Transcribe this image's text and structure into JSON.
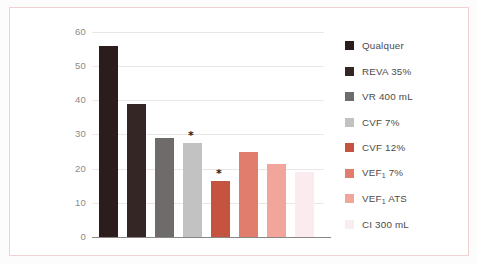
{
  "chart_data": {
    "type": "bar",
    "title": "",
    "subtitle": "",
    "xlabel": "",
    "ylabel": "",
    "ylim": [
      0,
      60
    ],
    "yticks": [
      "60",
      "50",
      "40",
      "30",
      "20",
      "10",
      "0"
    ],
    "grid": true,
    "legend_position": "right",
    "categories": [
      "Qualquer",
      "REVA 35%",
      "VR 400 mL",
      "CVF 7%",
      "CVF 12%",
      "VEF₁ 7%",
      "VEF₁ ATS",
      "CI 300 mL"
    ],
    "values": [
      56,
      39,
      29,
      27.5,
      16.5,
      25,
      21.5,
      19
    ],
    "colors": [
      "#2b1d1c",
      "#332624",
      "#6e6b6a",
      "#c3c2c3",
      "#c4543f",
      "#e07d6d",
      "#f2a69b",
      "#fbeaee"
    ],
    "annotations": [
      {
        "label": "*",
        "category": "CVF 7%",
        "value": 27.5
      },
      {
        "label": "*",
        "category": "CVF 12%",
        "value": 16.5
      }
    ]
  },
  "legend": {
    "items": [
      {
        "label": "Qualquer",
        "label_main": "Qualquer",
        "sub": "",
        "label_tail": "",
        "color": "#2b1d1c"
      },
      {
        "label": "REVA 35%",
        "label_main": "REVA 35%",
        "sub": "",
        "label_tail": "",
        "color": "#332624"
      },
      {
        "label": "VR 400 mL",
        "label_main": "VR 400 mL",
        "sub": "",
        "label_tail": "",
        "color": "#6e6b6a"
      },
      {
        "label": "CVF 7%",
        "label_main": "CVF 7%",
        "sub": "",
        "label_tail": "",
        "color": "#c3c2c3"
      },
      {
        "label": "CVF 12%",
        "label_main": "CVF 12%",
        "sub": "",
        "label_tail": "",
        "color": "#c4543f"
      },
      {
        "label": "VEF₁ 7%",
        "label_main": "VEF",
        "sub": "1",
        "label_tail": " 7%",
        "color": "#e07d6d"
      },
      {
        "label": "VEF₁ ATS",
        "label_main": "VEF",
        "sub": "1",
        "label_tail": " ATS",
        "color": "#f2a69b"
      },
      {
        "label": "CI 300 mL",
        "label_main": "CI 300 mL",
        "sub": "",
        "label_tail": "",
        "color": "#f7eef0"
      }
    ]
  },
  "style": {
    "frame_color": "#f0d2d4",
    "gridline_color": "#e9e6e5",
    "axis_color": "#8a8684",
    "tick_text_color": "#8d8987",
    "legend_text_color": "#4e4a49",
    "background": "#ffffff"
  }
}
